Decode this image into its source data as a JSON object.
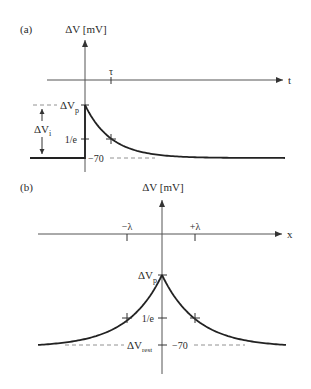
{
  "panel_a": {
    "label": "(a)",
    "y_axis_label": "ΔV [mV]",
    "x_axis_label": "t",
    "tau_label": "τ",
    "peak_label": "ΔV",
    "peak_sub": "p",
    "initial_label": "ΔV",
    "initial_sub": "i",
    "one_over_e_label": "1/e",
    "rest_value_label": "−70"
  },
  "panel_b": {
    "label": "(b)",
    "y_axis_label": "ΔV [mV]",
    "x_axis_label": "x",
    "neg_lambda_label": "−λ",
    "pos_lambda_label": "+λ",
    "peak_label": "ΔV",
    "peak_sub": "p",
    "one_over_e_label": "1/e",
    "rest_label": "ΔV",
    "rest_sub": "rest",
    "rest_value_label": "−70"
  },
  "colors": {
    "curve": "#222222",
    "axis": "#555555"
  }
}
